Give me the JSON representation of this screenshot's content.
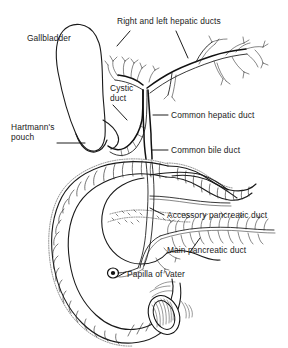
{
  "figure": {
    "background_color": "#ffffff",
    "ink_color": "#111111",
    "style": "black and white line drawing"
  },
  "labels": [
    {
      "id": "gallbladder",
      "text": "Gallbladder",
      "x": 27,
      "y": 38,
      "leader": "none"
    },
    {
      "id": "right-and-left-hepatic-ducts",
      "text": "Right and left hepatic ducts",
      "x": 117,
      "y": 19,
      "leader": "two-branch"
    },
    {
      "id": "cystic-duct",
      "text": "Cystic\nduct",
      "line1": "Cystic",
      "line2": "duct",
      "x": 110,
      "y": 85,
      "leader": "diagonal"
    },
    {
      "id": "hartmanns-pouch",
      "text": "Hartmann's\npouch",
      "line1": "Hartmann's",
      "line2": "pouch",
      "x": 11,
      "y": 124,
      "leader": "horizontal"
    },
    {
      "id": "common-hepatic-duct",
      "text": "Common hepatic duct",
      "x": 170,
      "y": 110,
      "leader": "horizontal"
    },
    {
      "id": "common-bile-duct",
      "text": "Common bile duct",
      "x": 170,
      "y": 145,
      "leader": "horizontal"
    },
    {
      "id": "accessory-pancreatic-duct",
      "text": "Accessory pancreatic duct",
      "x": 166,
      "y": 210,
      "leader": "horizontal"
    },
    {
      "id": "main-pancreatic-duct",
      "text": "Main pancreatic duct",
      "x": 166,
      "y": 245,
      "leader": "diagonal"
    },
    {
      "id": "papilla-of-vater",
      "text": "Papilla of Vater",
      "x": 124,
      "y": 270,
      "leader": "diagonal"
    }
  ],
  "structures": [
    {
      "id": "gallbladder-body",
      "name": "Gallbladder"
    },
    {
      "id": "hartmanns-pouch-bulge",
      "name": "Hartmann's pouch"
    },
    {
      "id": "cystic-duct-tube",
      "name": "Cystic duct"
    },
    {
      "id": "right-hepatic-duct-tree",
      "name": "Right hepatic duct"
    },
    {
      "id": "left-hepatic-duct-tree",
      "name": "Left hepatic duct"
    },
    {
      "id": "common-hepatic-duct-tube",
      "name": "Common hepatic duct"
    },
    {
      "id": "common-bile-duct-tube",
      "name": "Common bile duct"
    },
    {
      "id": "duodenum-loop",
      "name": "Duodenum"
    },
    {
      "id": "pancreas-body",
      "name": "Pancreas"
    },
    {
      "id": "accessory-pancreatic-duct-tube",
      "name": "Accessory pancreatic duct"
    },
    {
      "id": "main-pancreatic-duct-tube",
      "name": "Main pancreatic duct"
    },
    {
      "id": "papilla-of-vater-marker",
      "name": "Papilla of Vater"
    }
  ]
}
